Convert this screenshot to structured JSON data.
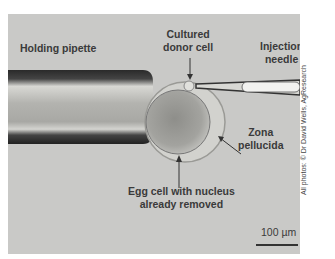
{
  "labels": {
    "holding_pipette": "Holding pipette",
    "cultured_donor_cell_line1": "Cultured",
    "cultured_donor_cell_line2": "donor cell",
    "injection_needle_line1": "Injection",
    "injection_needle_line2": "needle",
    "zona_pellucida_line1": "Zona",
    "zona_pellucida_line2": "pellucida",
    "egg_cell_line1": "Egg cell with nucleus",
    "egg_cell_line2": "already removed"
  },
  "scale_bar": {
    "label": "100 µm"
  },
  "credit": "All photos: © Dr David Wells, AgResearch",
  "colors": {
    "background": "#c9c9c7",
    "label_text": "#3a3a3a",
    "pipette_dark": "#2a2a2a"
  }
}
